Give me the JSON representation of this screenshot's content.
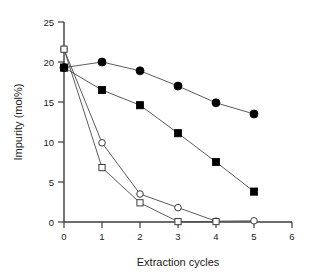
{
  "chart_data": {
    "type": "line",
    "title": "",
    "subtitle": "",
    "xlabel": "Extraction cycles",
    "ylabel": "Impurity (mol%)",
    "xlim": [
      0,
      6
    ],
    "ylim": [
      0,
      25
    ],
    "xticks": [
      0,
      1,
      2,
      3,
      4,
      5,
      6
    ],
    "xticklabels": [
      "0",
      "1",
      "2",
      "3",
      "4",
      "5",
      "6"
    ],
    "yticks": [
      0,
      5,
      10,
      15,
      20,
      25
    ],
    "yticklabels": [
      "0",
      "5",
      "10",
      "15",
      "20",
      "25"
    ],
    "grid": false,
    "legend": "none",
    "series": [
      {
        "name": "filled-circle",
        "marker": "filled-circle",
        "x": [
          0,
          1,
          2,
          3,
          4,
          5
        ],
        "values": [
          19.3,
          20.0,
          18.9,
          17.0,
          14.9,
          13.5
        ]
      },
      {
        "name": "filled-square",
        "marker": "filled-square",
        "x": [
          0,
          1,
          2,
          3,
          4,
          5
        ],
        "values": [
          19.3,
          16.5,
          14.6,
          11.1,
          7.5,
          3.8
        ]
      },
      {
        "name": "open-circle",
        "marker": "open-circle",
        "x": [
          0,
          1,
          2,
          3,
          4,
          5
        ],
        "values": [
          21.6,
          9.9,
          3.5,
          1.8,
          0.1,
          0.15
        ]
      },
      {
        "name": "open-square",
        "marker": "open-square",
        "x": [
          0,
          1,
          2,
          3,
          4
        ],
        "values": [
          21.6,
          6.8,
          2.4,
          0.05,
          0.05
        ]
      }
    ]
  },
  "colors": {
    "axis": "#3d3d3d",
    "line": "#4a4a4a",
    "marker_fill": "#000000",
    "marker_open_fill": "#ffffff",
    "background": "#ffffff",
    "text": "#1a1a1a"
  }
}
